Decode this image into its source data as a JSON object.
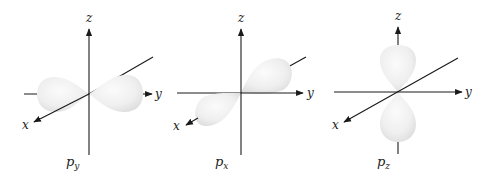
{
  "figure": {
    "colors": {
      "axis": "#1a1a1a",
      "lobe_light": "#fafafa",
      "lobe_dark": "#dcdcdc",
      "text": "#222222"
    },
    "panels": [
      {
        "id": "py",
        "caption_main": "p",
        "caption_sub": "y",
        "axis_labels": {
          "x": "x",
          "y": "y",
          "z": "z"
        },
        "orientation": "lobes along y-axis (horizontal)"
      },
      {
        "id": "px",
        "caption_main": "p",
        "caption_sub": "x",
        "axis_labels": {
          "x": "x",
          "y": "y",
          "z": "z"
        },
        "orientation": "lobes along x-axis (diagonal)"
      },
      {
        "id": "pz",
        "caption_main": "p",
        "caption_sub": "z",
        "axis_labels": {
          "x": "x",
          "y": "y",
          "z": "z"
        },
        "orientation": "lobes along z-axis (vertical)"
      }
    ]
  }
}
